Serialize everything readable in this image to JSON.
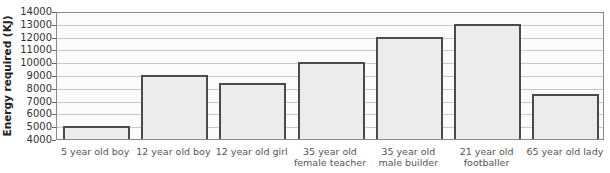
{
  "chart_data": {
    "type": "bar",
    "title": "",
    "xlabel": "",
    "ylabel": "Energy required (KJ)",
    "ylim": [
      4000,
      14000
    ],
    "yticks": [
      4000,
      5000,
      6000,
      7000,
      8000,
      9000,
      10000,
      11000,
      12000,
      13000,
      14000
    ],
    "grid": true,
    "legend": null,
    "categories": [
      "5 year old boy",
      "12 year old boy",
      "12 year old girl",
      "35 year old\nfemale teacher",
      "35 year old\nmale builder",
      "21 year old\nfootballer",
      "65 year old lady"
    ],
    "values": [
      5000,
      9000,
      8400,
      10000,
      12000,
      13000,
      7500
    ]
  },
  "colors": {
    "bar_fill": "#ececec",
    "bar_border": "#4a4a4a",
    "grid": "#c9c9c9"
  }
}
